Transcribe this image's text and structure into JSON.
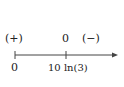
{
  "sign_chart": {
    "above": {
      "left_sign": "(+)",
      "zero": "0",
      "right_sign": "(−)"
    },
    "below": {
      "start": "0",
      "critical": "10 ln(3)"
    }
  }
}
